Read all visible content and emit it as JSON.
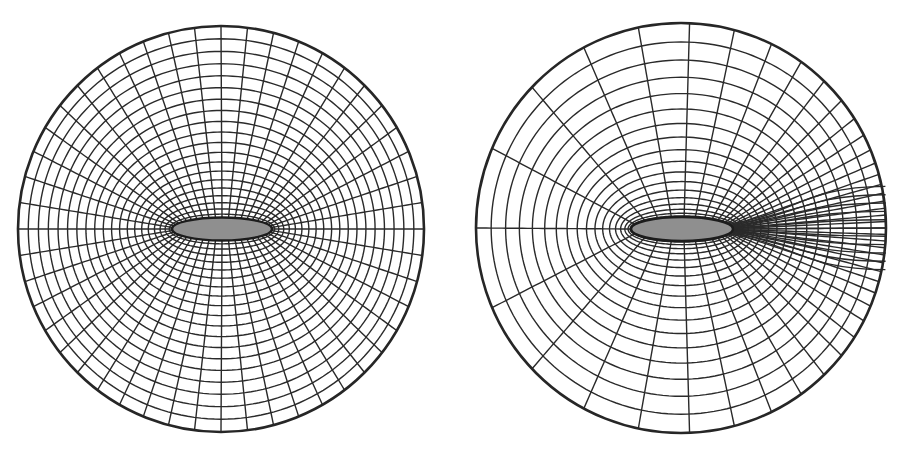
{
  "figure": {
    "width": 897,
    "height": 459,
    "background": "#ffffff",
    "line_color": "#2a2a2a",
    "body_fill": "#8f8f8f"
  },
  "panels": [
    {
      "id": "left-mesh",
      "description": "Symmetric O-type elliptic grid around an elliptical body",
      "outer_circle": {
        "cx": 221,
        "cy": 229,
        "r": 203
      },
      "body_ellipse": {
        "cx": 222,
        "cy": 229,
        "rx": 50,
        "ry": 11.5
      },
      "radial_lines": 48,
      "rings": 20,
      "radial_clustering": 1.35,
      "wake_clustering": 0
    },
    {
      "id": "right-mesh",
      "description": "O-type grid with circumferential clustering toward the downstream (wake) side of the body",
      "outer_circle": {
        "cx": 681,
        "cy": 228,
        "r": 205
      },
      "body_ellipse": {
        "cx": 682,
        "cy": 229,
        "rx": 51,
        "ry": 12
      },
      "radial_lines": 44,
      "rings": 18,
      "radial_clustering": 1.8,
      "wake_clustering": 0.78
    }
  ]
}
